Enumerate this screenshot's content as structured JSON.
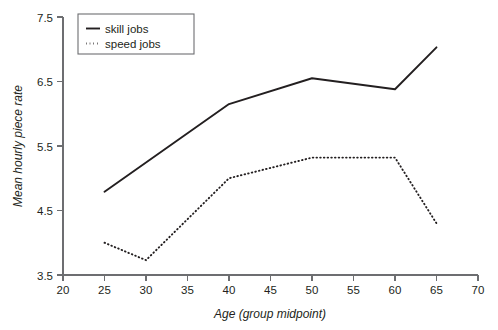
{
  "chart_data": {
    "type": "line",
    "title": "",
    "xlabel": "Age (group midpoint)",
    "ylabel": "Mean hourly piece rate",
    "xlim": [
      20,
      70
    ],
    "ylim": [
      3.5,
      7.5
    ],
    "xticks": [
      20,
      25,
      30,
      35,
      40,
      45,
      50,
      55,
      60,
      65,
      70
    ],
    "yticks": [
      3.5,
      4.5,
      5.5,
      6.5,
      7.5
    ],
    "xtick_labels": [
      "20",
      "25",
      "30",
      "35",
      "40",
      "45",
      "50",
      "55",
      "60",
      "65",
      "70"
    ],
    "ytick_labels": [
      "3.5",
      "4.5",
      "5.5",
      "6.5",
      "7.5"
    ],
    "grid": false,
    "legend_position": "top-center",
    "series": [
      {
        "name": "skill jobs",
        "style": "solid",
        "color": "#231f20",
        "x": [
          25,
          40,
          50,
          60,
          65
        ],
        "values": [
          4.79,
          6.15,
          6.55,
          6.38,
          7.03
        ]
      },
      {
        "name": "speed jobs",
        "style": "dotted",
        "color": "#231f20",
        "x": [
          25,
          30,
          40,
          50,
          60,
          65
        ],
        "values": [
          4.0,
          3.73,
          5.0,
          5.32,
          5.32,
          4.3
        ]
      }
    ]
  },
  "legend": {
    "items": [
      {
        "label": "skill jobs",
        "style": "solid"
      },
      {
        "label": "speed jobs",
        "style": "dotted"
      }
    ]
  },
  "axes": {
    "x_title": "Age (group midpoint)",
    "y_title": "Mean hourly piece rate"
  }
}
